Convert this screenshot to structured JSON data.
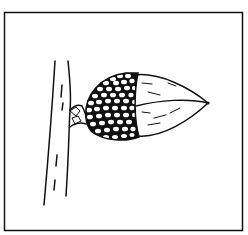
{
  "figure": {
    "subject": "acorn on branch",
    "style": "black line drawing on white",
    "colors": {
      "ink": "#111111",
      "paper": "#ffffff"
    },
    "parts": [
      {
        "name": "frame",
        "label": "border"
      },
      {
        "name": "branch",
        "label": "twig"
      },
      {
        "name": "stalk",
        "label": "stem"
      },
      {
        "name": "cap",
        "label": "scaly cupule"
      },
      {
        "name": "nut",
        "label": "acorn nut"
      },
      {
        "name": "tip",
        "label": "apex point"
      }
    ]
  }
}
